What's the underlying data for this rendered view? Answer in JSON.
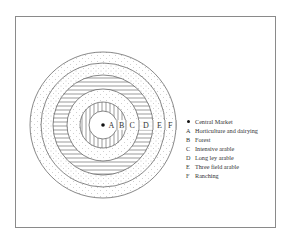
{
  "figure": {
    "center": {
      "x": 103,
      "y": 125
    },
    "center_dot_label": "Central Market",
    "rings": [
      {
        "key": "A",
        "label": "Horticulture and dairying",
        "radius": 14,
        "fill": "white"
      },
      {
        "key": "B",
        "label": "Forest",
        "radius": 23,
        "fill": "vertical-hatch"
      },
      {
        "key": "C",
        "label": "Intensive arable",
        "radius": 36,
        "fill": "dots"
      },
      {
        "key": "D",
        "label": "Long ley arable",
        "radius": 50,
        "fill": "horizontal-hatch"
      },
      {
        "key": "E",
        "label": "Three field arable",
        "radius": 62,
        "fill": "dots"
      },
      {
        "key": "F",
        "label": "Ranching",
        "radius": 73,
        "fill": "dots"
      }
    ],
    "ring_letters": [
      {
        "text": "A",
        "x": 110
      },
      {
        "text": "B",
        "x": 122
      },
      {
        "text": "C",
        "x": 133
      },
      {
        "text": "D",
        "x": 145
      },
      {
        "text": "E",
        "x": 157
      },
      {
        "text": "F",
        "x": 169
      }
    ]
  },
  "legend": {
    "items": [
      {
        "key": "●",
        "label": "Central Market"
      },
      {
        "key": "A",
        "label": "Horticulture and dairying"
      },
      {
        "key": "B",
        "label": "Forest"
      },
      {
        "key": "C",
        "label": "Intensive arable"
      },
      {
        "key": "D",
        "label": "Long ley arable"
      },
      {
        "key": "E",
        "label": "Three field arable"
      },
      {
        "key": "F",
        "label": "Ranching"
      }
    ]
  },
  "colors": {
    "line": "#555555",
    "dot": "#9a9a9a",
    "hatch": "#555555",
    "frame": "#8a8a8a"
  }
}
